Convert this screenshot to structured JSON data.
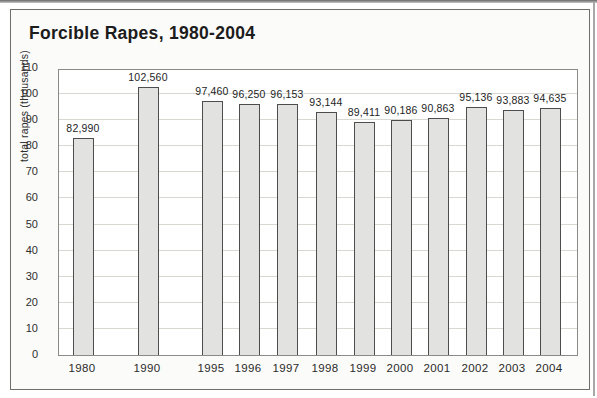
{
  "chart_data": {
    "type": "bar",
    "title": "Forcible Rapes, 1980-2004",
    "xlabel": "",
    "ylabel": "total rapes (thousands)",
    "categories": [
      "1980",
      "1990",
      "1995",
      "1996",
      "1997",
      "1998",
      "1999",
      "2000",
      "2001",
      "2002",
      "2003",
      "2004"
    ],
    "values": [
      82990,
      102560,
      97460,
      96250,
      96153,
      93144,
      89411,
      90186,
      90863,
      95136,
      93883,
      94635
    ],
    "value_labels": [
      "82,990",
      "102,560",
      "97,460",
      "96,250",
      "96,153",
      "93,144",
      "89,411",
      "90,186",
      "90,863",
      "95,136",
      "93,883",
      "94,635"
    ],
    "value_scale_to_axis": 0.001,
    "ylim": [
      0,
      110
    ],
    "yticks": [
      0,
      10,
      20,
      30,
      40,
      50,
      60,
      70,
      80,
      90,
      100,
      110
    ],
    "grid": true,
    "legend": "none",
    "colors": {
      "bar_fill": "#e2e2e0",
      "bar_border": "#4d4d4d",
      "gridline": "#d8d8d3",
      "plot_border": "#8a8a86",
      "frame_border": "#6e6e6a",
      "title_text": "#1c1c1c",
      "tick_text": "#2e2e2e"
    }
  }
}
